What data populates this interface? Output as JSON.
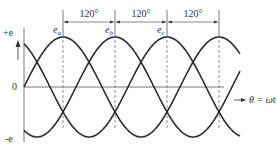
{
  "axes": {
    "y_positive_label": "+e",
    "y_zero_label": "0",
    "y_negative_label": "-e",
    "x_label": "θ = ωt"
  },
  "phase_labels": [
    {
      "name": "e",
      "sub": "a",
      "peak_x": 63
    },
    {
      "name": "e",
      "sub": "b",
      "peak_x": 115
    },
    {
      "name": "e",
      "sub": "c",
      "peak_x": 167
    }
  ],
  "phase_spacing": {
    "label": "120°",
    "markers_x": [
      63,
      115,
      167,
      219
    ]
  },
  "colors": {
    "curve": "#2a2a2a",
    "axis": "#555555",
    "dashed": "#666666",
    "text": "#333333"
  },
  "chart_data": {
    "type": "line",
    "xlabel": "θ = ωt",
    "ylabel": "e",
    "series": [
      {
        "name": "e_a",
        "phase_deg": 0
      },
      {
        "name": "e_b",
        "phase_deg": -120
      },
      {
        "name": "e_c",
        "phase_deg": -240
      }
    ],
    "annotations": [
      "120°",
      "120°",
      "120°"
    ],
    "ylim": [
      "-e",
      "+e"
    ]
  },
  "geometry": {
    "x0": 24,
    "x_end": 240,
    "axis_end": 224,
    "y0": 87,
    "amp": 50,
    "period": 156
  }
}
